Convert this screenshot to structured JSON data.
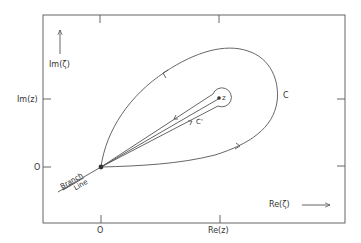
{
  "diagram": {
    "axes": {
      "y_axis_label": "Im(ζ)",
      "x_axis_label": "Re(ζ)",
      "left_ticks": [
        "Im(z)",
        "O"
      ],
      "bottom_ticks": [
        "O",
        "Re(z)"
      ]
    },
    "points": {
      "origin_label": "",
      "z_label": "z"
    },
    "contours": {
      "outer_label": "C",
      "inner_label": "C'"
    },
    "branch_line_label_1": "Branch",
    "branch_line_label_2": "Line",
    "colors": {
      "line": "#555555",
      "text": "#333333",
      "background": "#ffffff"
    }
  }
}
